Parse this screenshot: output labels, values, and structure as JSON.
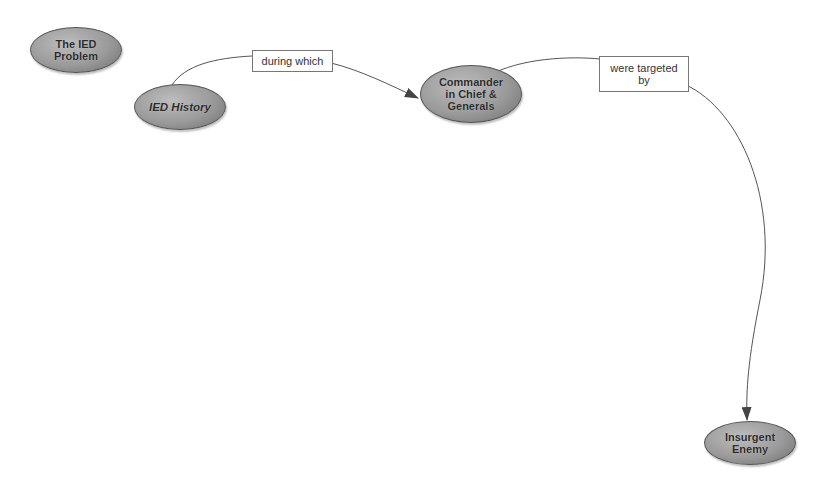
{
  "diagram": {
    "nodes": [
      {
        "id": "ied-problem",
        "label": "The IED\nProblem"
      },
      {
        "id": "ied-history",
        "label": "IED History"
      },
      {
        "id": "commander",
        "label": "Commander\nin Chief &\nGenerals"
      },
      {
        "id": "insurgent",
        "label": "Insurgent\nEnemy"
      }
    ],
    "links": [
      {
        "from": "ied-history",
        "to": "commander",
        "label": "during which"
      },
      {
        "from": "commander",
        "to": "insurgent",
        "label": "were targeted\nby"
      }
    ],
    "colors": {
      "node_fill": "#9a9a9a",
      "node_border": "#555555",
      "line": "#555555",
      "label_border": "#777777"
    }
  }
}
